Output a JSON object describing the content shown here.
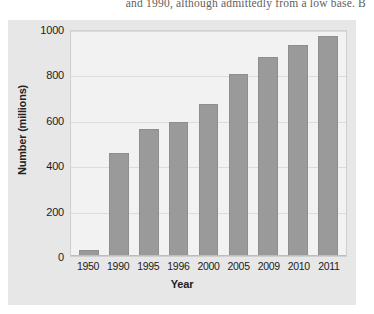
{
  "page": {
    "body_text_fragment": "and 1990, although admittedly from a low base. B"
  },
  "chart_data": {
    "type": "bar",
    "title": "",
    "xlabel": "Year",
    "ylabel": "Number (millions)",
    "categories": [
      "1950",
      "1990",
      "1995",
      "1996",
      "2000",
      "2005",
      "2009",
      "2010",
      "2011"
    ],
    "values": [
      25,
      455,
      560,
      590,
      670,
      800,
      877,
      930,
      970
    ],
    "ylim": [
      0,
      1000
    ],
    "yticks": [
      0,
      200,
      400,
      600,
      800,
      1000
    ],
    "ytick_labels": [
      "0",
      "200",
      "400",
      "600",
      "800",
      "1000"
    ],
    "grid": true,
    "legend": "none",
    "bar_color": "#9a9a9a",
    "plot_background": "#f2f2f2",
    "figure_background": "#e7e7e7"
  }
}
